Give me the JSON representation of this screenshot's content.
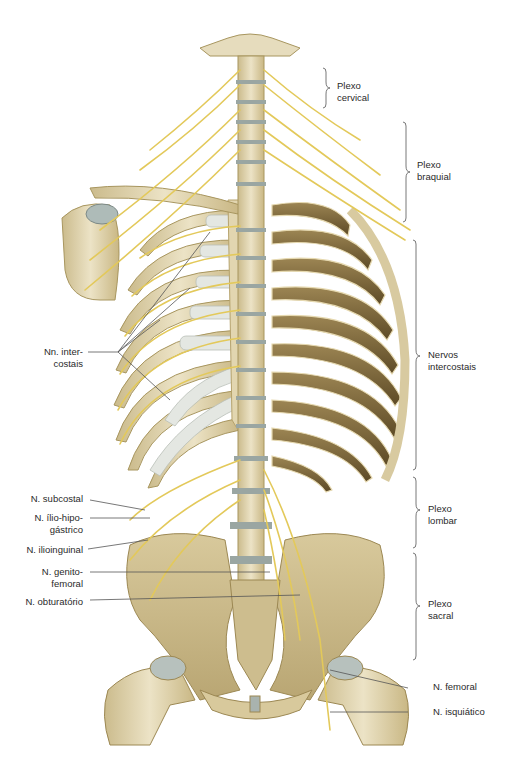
{
  "figure": {
    "colors": {
      "bone_light": "#e9dfc0",
      "bone_mid": "#d4c59a",
      "bone_dark": "#8a7748",
      "rib_back_dark": "#6e5a32",
      "cartilage": "#dfe3e0",
      "disc": "#9aa6a2",
      "nerve": "#e3c95a",
      "leader_line": "#555555",
      "bracket": "#555555",
      "text": "#2a2a2a"
    }
  },
  "labels": {
    "right": {
      "plexo_cervical": "Plexo\ncervical",
      "plexo_braquial": "Plexo\nbraquial",
      "nervos_intercostais": "Nervos\nintercostais",
      "plexo_lombar": "Plexo\nlombar",
      "plexo_sacral": "Plexo\nsacral",
      "n_femoral": "N. femoral",
      "n_isquiatico": "N. isquiático"
    },
    "left": {
      "nn_intercostais": "Nn. inter-\ncostais",
      "n_subcostal": "N. subcostal",
      "n_ilio_hipogastrico": "N. ílio-hipo-\ngástrico",
      "n_ilioinguinal": "N. ilioinguinal",
      "n_genitofemoral": "N. genito-\nfemoral",
      "n_obturatorio": "N. obturatório"
    }
  }
}
